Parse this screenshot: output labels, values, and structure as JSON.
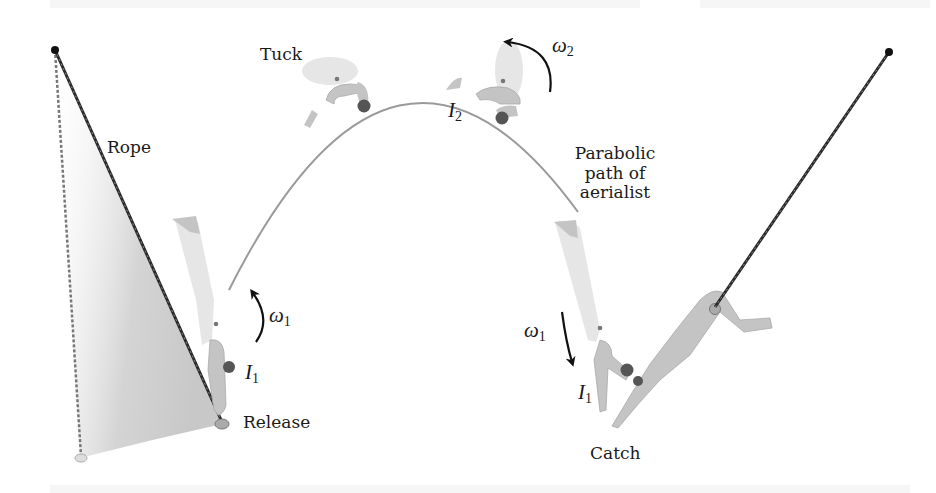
{
  "diagram": {
    "labels": {
      "rope": "Rope",
      "tuck": "Tuck",
      "parabolic_line1": "Parabolic",
      "parabolic_line2": "path of",
      "parabolic_line3": "aerialist",
      "release": "Release",
      "catch": "Catch"
    },
    "symbols": {
      "omega1_left": {
        "base": "ω",
        "sub": "1"
      },
      "I1_left": {
        "base": "I",
        "sub": "1"
      },
      "omega2": {
        "base": "ω",
        "sub": "2"
      },
      "I2": {
        "base": "I",
        "sub": "2"
      },
      "omega1_right": {
        "base": "ω",
        "sub": "1"
      },
      "I1_right": {
        "base": "I",
        "sub": "1"
      }
    },
    "colors": {
      "rope": "#2a2a2a",
      "path": "#9a9a9a",
      "figure": "#c4c4c4",
      "figure_light": "#e4e4e4",
      "hair": "#555555",
      "swing_fill": "#d8d8d8",
      "arrow": "#111111"
    }
  }
}
